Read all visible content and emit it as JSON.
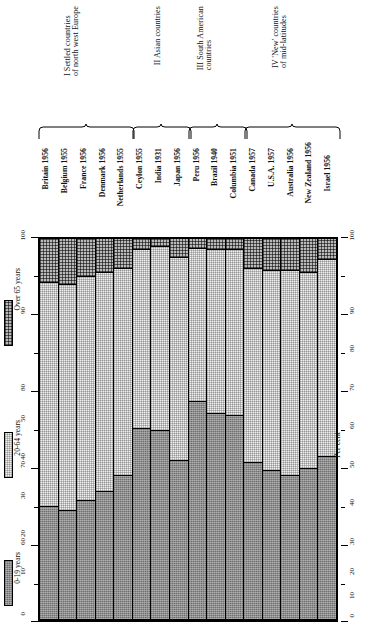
{
  "chart_data": {
    "type": "bar",
    "subtype": "stacked-percentage-column",
    "title": "",
    "xlabel": "",
    "ylabel": "Per cent",
    "ylim": [
      0,
      100
    ],
    "yticks": [
      0,
      10,
      20,
      30,
      40,
      50,
      60,
      70,
      80,
      90,
      100
    ],
    "ytick_labels": [
      "0",
      "10",
      "20",
      "30",
      "40",
      "50",
      "60",
      "70",
      "80",
      "90",
      "100"
    ],
    "grid": false,
    "legend_position": "left",
    "stack_order_bottom_to_top": [
      "0-19 years",
      "20-64 years",
      "Over 65 years"
    ],
    "categories": [
      "Britain 1956",
      "Belgium 1955",
      "France 1956",
      "Denmark 1956",
      "Netherlands 1955",
      "Ceylon 1955",
      "India 1931",
      "Japan 1956",
      "Peru 1956",
      "Brazil 1940",
      "Columbia 1951",
      "Canada 1957",
      "U.S.A. 1957",
      "Australia 1956",
      "New Zealand 1956",
      "Israel 1956"
    ],
    "series": [
      {
        "name": "0-19 years",
        "values": [
          29.5,
          28.5,
          31,
          33.5,
          37.5,
          50,
          49.5,
          41.5,
          57,
          54,
          53.5,
          41,
          39,
          37.5,
          39.5,
          42.5
        ]
      },
      {
        "name": "20-64 years",
        "values": [
          59,
          59.5,
          59,
          57.5,
          54.5,
          47,
          48.5,
          53.5,
          40.5,
          43,
          43.5,
          51,
          52.5,
          54,
          51.5,
          52
        ]
      },
      {
        "name": "Over 65 years",
        "values": [
          11.5,
          12,
          10,
          9,
          8,
          3,
          2,
          5,
          2.5,
          3,
          3,
          8,
          8.5,
          8.5,
          9,
          5.5
        ]
      }
    ],
    "annotations": {
      "groups": [
        {
          "numeral": "I",
          "label": "I Settled countries\nof north west Europe",
          "members": [
            "Britain 1956",
            "Belgium 1955",
            "France 1956",
            "Denmark 1956",
            "Netherlands 1955"
          ]
        },
        {
          "numeral": "II",
          "label": "II Asian countries",
          "members": [
            "Ceylon 1955",
            "India 1931",
            "Japan 1956"
          ]
        },
        {
          "numeral": "III",
          "label": "III South American\ncountries",
          "members": [
            "Peru 1956",
            "Brazil 1940",
            "Columbia 1951"
          ]
        },
        {
          "numeral": "IV",
          "label": "IV 'New' countries\nof mid-latitudes",
          "members": [
            "Canada 1957",
            "U.S.A. 1957",
            "Australia 1956",
            "New Zealand 1956",
            "Israel 1956"
          ]
        }
      ]
    }
  },
  "legend": {
    "items": [
      {
        "key": "young",
        "label": "0-19 years",
        "swatch": "dark-stipple"
      },
      {
        "key": "mid",
        "label": "20-64 years",
        "swatch": "light-stipple"
      },
      {
        "key": "old",
        "label": "Over 65 years",
        "swatch": "checker"
      }
    ]
  },
  "axes": {
    "left": {
      "labels": [
        "0",
        "10",
        "20",
        "30",
        "40",
        "50",
        "60",
        "70",
        "80",
        "90",
        "100"
      ]
    },
    "right": {
      "labels": [
        "0",
        "10",
        "20",
        "30",
        "40",
        "50",
        "60",
        "70",
        "80",
        "90",
        "100"
      ],
      "title": "Per cent"
    }
  },
  "colors": {
    "young": "#8e8e8e",
    "mid": "#efefef",
    "old": "#b9b9b9",
    "rule": "#000000",
    "background": "#ffffff"
  }
}
